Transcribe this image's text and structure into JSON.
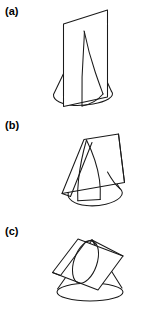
{
  "figure": {
    "background_color": "#ffffff",
    "line_color": "#1a1a1a",
    "width": 154,
    "height": 315,
    "panel_count": 3
  },
  "panels": [
    {
      "label": "(a)",
      "name": "panel-a",
      "section_type": "hyperbola",
      "description": "Cone intersected by a vertical plane parallel to the cone axis, producing a hyperbolic cross-section",
      "cone": {
        "apex": [
          85,
          30
        ],
        "base_center": [
          83,
          95
        ],
        "base_rx": 30,
        "base_ry": 9
      },
      "plane": {
        "orientation": "vertical",
        "corners": [
          [
            63,
            24
          ],
          [
            108,
            10
          ],
          [
            108,
            98
          ],
          [
            63,
            106
          ]
        ]
      }
    },
    {
      "label": "(b)",
      "name": "panel-b",
      "section_type": "parabola",
      "description": "Cone intersected by a plane parallel to a slant side, producing a parabolic cross-section",
      "cone": {
        "apex": [
          90,
          139
        ],
        "base_center": [
          96,
          196
        ],
        "base_rx": 27,
        "base_ry": 8
      },
      "plane": {
        "orientation": "tilted",
        "corners": [
          [
            73,
            146
          ],
          [
            118,
            132
          ],
          [
            131,
            178
          ],
          [
            88,
            200
          ]
        ]
      }
    },
    {
      "label": "(c)",
      "name": "panel-c",
      "section_type": "ellipse",
      "description": "Cone intersected by an oblique plane cutting all slant sides, producing an elliptical cross-section",
      "cone": {
        "apex": [
          92,
          240
        ],
        "base_center": [
          90,
          292
        ],
        "base_rx": 33,
        "base_ry": 9
      },
      "plane": {
        "orientation": "oblique",
        "corners": [
          [
            55,
            272
          ],
          [
            79,
            239
          ],
          [
            124,
            256
          ],
          [
            101,
            290
          ]
        ]
      }
    }
  ]
}
